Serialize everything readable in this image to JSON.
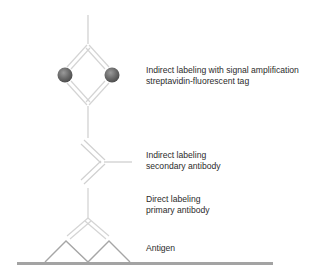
{
  "labels": {
    "streptavidin": {
      "line1": "Indirect labeling with signal amplification",
      "line2": "streptavidin-fluorescent tag"
    },
    "secondary": {
      "line1": "Indirect labeling",
      "line2": "secondary antibody"
    },
    "primary": {
      "line1": "Direct labeling",
      "line2": "primary antibody"
    },
    "antigen": {
      "line1": "Antigen"
    }
  },
  "colors": {
    "antibody_line": "#d4d4d4",
    "antigen_line": "#a8a8a8",
    "surface_line": "#a0a0a0",
    "fluorophore": "#6e6e6e",
    "text": "#2b2b2b"
  }
}
